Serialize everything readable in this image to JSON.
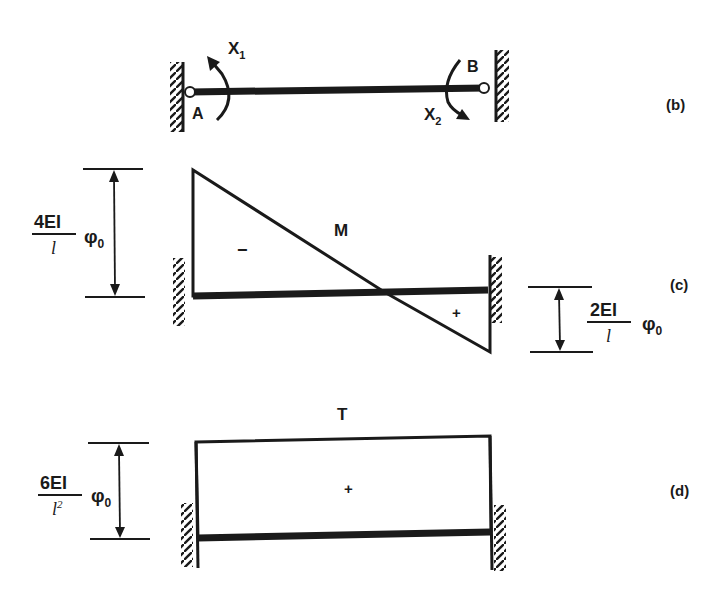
{
  "figure": {
    "panels": [
      {
        "id": "b",
        "label": "(b)",
        "description": "Fixed-fixed beam with hinged ends A and B, redundant moments X1 and X2",
        "nodes": {
          "left": "A",
          "right": "B"
        },
        "moments": {
          "left": {
            "name": "X",
            "sub": "1"
          },
          "right": {
            "name": "X",
            "sub": "2"
          }
        }
      },
      {
        "id": "c",
        "label": "(c)",
        "diagram_title": "M",
        "left_sign": "−",
        "right_sign": "+",
        "left_magnitude": {
          "numerator": "4EI",
          "denominator": "l",
          "factor": "φ",
          "factor_sub": "0"
        },
        "right_magnitude": {
          "numerator": "2EI",
          "denominator": "l",
          "factor": "φ",
          "factor_sub": "0"
        }
      },
      {
        "id": "d",
        "label": "(d)",
        "diagram_title": "T",
        "sign": "+",
        "magnitude": {
          "numerator": "6EI",
          "denominator": "l",
          "denominator_exp": "2",
          "factor": "φ",
          "factor_sub": "0"
        }
      }
    ]
  },
  "colors": {
    "ink": "#1a1a1a",
    "background": "#ffffff"
  }
}
